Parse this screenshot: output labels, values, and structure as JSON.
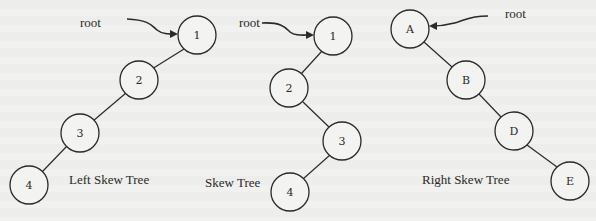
{
  "diagram": {
    "trees": [
      {
        "id": "left",
        "caption": "Left Skew Tree",
        "root_label": "root",
        "nodes": [
          {
            "label": "1",
            "x": 197,
            "y": 35
          },
          {
            "label": "2",
            "x": 139,
            "y": 80
          },
          {
            "label": "3",
            "x": 80,
            "y": 133
          },
          {
            "label": "4",
            "x": 29,
            "y": 185
          }
        ],
        "edges": [
          [
            0,
            1
          ],
          [
            1,
            2
          ],
          [
            2,
            3
          ]
        ]
      },
      {
        "id": "middle",
        "caption": "Skew Tree",
        "root_label": "root",
        "nodes": [
          {
            "label": "1",
            "x": 333,
            "y": 36
          },
          {
            "label": "2",
            "x": 289,
            "y": 88
          },
          {
            "label": "3",
            "x": 342,
            "y": 141
          },
          {
            "label": "4",
            "x": 290,
            "y": 192
          }
        ],
        "edges": [
          [
            0,
            1
          ],
          [
            1,
            2
          ],
          [
            2,
            3
          ]
        ]
      },
      {
        "id": "right",
        "caption": "Right Skew Tree",
        "root_label": "root",
        "nodes": [
          {
            "label": "A",
            "x": 410,
            "y": 29
          },
          {
            "label": "B",
            "x": 466,
            "y": 80
          },
          {
            "label": "D",
            "x": 514,
            "y": 131
          },
          {
            "label": "E",
            "x": 570,
            "y": 181
          }
        ],
        "edges": [
          [
            0,
            1
          ],
          [
            1,
            2
          ],
          [
            2,
            3
          ]
        ]
      }
    ],
    "colors": {
      "background": "#f1f1ef",
      "stroke": "#2a2a2a"
    }
  }
}
